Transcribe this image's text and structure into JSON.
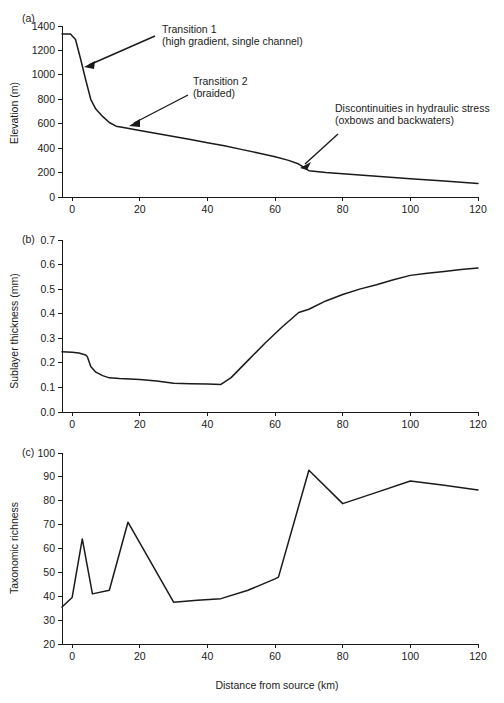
{
  "figure": {
    "xlabel": "Distance from source (km)",
    "panels": [
      {
        "letter": "(a)",
        "ylabel": "Elevation (m)",
        "yticks": [
          "0",
          "200",
          "400",
          "600",
          "800",
          "1000",
          "1200",
          "1400"
        ],
        "xticks": [
          "0",
          "20",
          "40",
          "60",
          "80",
          "100",
          "120"
        ]
      },
      {
        "letter": "(b)",
        "ylabel": "Sublayer thickness (mm)",
        "yticks": [
          "0.0",
          "0.1",
          "0.2",
          "0.3",
          "0.4",
          "0.5",
          "0.6",
          "0.7"
        ],
        "xticks": [
          "0",
          "20",
          "40",
          "60",
          "80",
          "100",
          "120"
        ]
      },
      {
        "letter": "(c)",
        "ylabel": "Taxonomic richness",
        "yticks": [
          "20",
          "30",
          "40",
          "50",
          "60",
          "70",
          "80",
          "90",
          "100"
        ],
        "xticks": [
          "0",
          "20",
          "40",
          "60",
          "80",
          "100",
          "120"
        ]
      }
    ],
    "annotations": [
      {
        "id": "transition-1",
        "line1": "Transition 1",
        "line2": "(high gradient, single channel)"
      },
      {
        "id": "transition-2",
        "line1": "Transition 2",
        "line2": "(braided)"
      },
      {
        "id": "discontinuities",
        "line1": "Discontinuities in hydraulic stress",
        "line2": "(oxbows and backwaters)"
      }
    ],
    "colors": {
      "line": "#1a1a1a",
      "axis": "#1a1a1a",
      "background": "#ffffff"
    }
  },
  "chart_data": [
    {
      "type": "line",
      "panel": "(a)",
      "title": "",
      "xlabel": "Distance from source (km)",
      "ylabel": "Elevation (m)",
      "xlim": [
        -3,
        120
      ],
      "ylim": [
        0,
        1400
      ],
      "xticks": [
        0,
        20,
        40,
        60,
        80,
        100,
        120
      ],
      "yticks": [
        0,
        200,
        400,
        600,
        800,
        1000,
        1200,
        1400
      ],
      "grid": false,
      "legend": "none",
      "x": [
        -3,
        -0.5,
        1,
        2.5,
        4,
        5.5,
        7,
        9,
        11,
        13,
        16,
        20,
        25,
        30,
        35,
        40,
        45,
        50,
        55,
        60,
        64,
        67,
        70,
        75,
        80,
        90,
        100,
        110,
        120
      ],
      "y": [
        1335,
        1335,
        1290,
        1130,
        960,
        800,
        720,
        660,
        610,
        580,
        565,
        545,
        520,
        495,
        470,
        445,
        420,
        390,
        360,
        330,
        300,
        270,
        215,
        200,
        190,
        170,
        150,
        130,
        110
      ]
    },
    {
      "type": "line",
      "panel": "(b)",
      "title": "",
      "xlabel": "Distance from source (km)",
      "ylabel": "Sublayer thickness (mm)",
      "xlim": [
        -3,
        120
      ],
      "ylim": [
        0.0,
        0.7
      ],
      "xticks": [
        0,
        20,
        40,
        60,
        80,
        100,
        120
      ],
      "yticks": [
        0.0,
        0.1,
        0.2,
        0.3,
        0.4,
        0.5,
        0.6,
        0.7
      ],
      "grid": false,
      "legend": "none",
      "x": [
        -3,
        0,
        2,
        4,
        4.5,
        5.5,
        7,
        9,
        11,
        14,
        20,
        25,
        30,
        35,
        40,
        44,
        47,
        52,
        57,
        62,
        67,
        70,
        75,
        80,
        85,
        90,
        95,
        100,
        105,
        110,
        115,
        120
      ],
      "y": [
        0.245,
        0.243,
        0.24,
        0.232,
        0.225,
        0.185,
        0.162,
        0.148,
        0.139,
        0.136,
        0.132,
        0.126,
        0.117,
        0.115,
        0.114,
        0.112,
        0.14,
        0.21,
        0.28,
        0.345,
        0.405,
        0.418,
        0.452,
        0.478,
        0.5,
        0.518,
        0.538,
        0.556,
        0.565,
        0.572,
        0.58,
        0.586
      ]
    },
    {
      "type": "line",
      "panel": "(c)",
      "title": "",
      "xlabel": "Distance from source (km)",
      "ylabel": "Taxonomic richness",
      "xlim": [
        -3,
        120
      ],
      "ylim": [
        20,
        100
      ],
      "xticks": [
        0,
        20,
        40,
        60,
        80,
        100,
        120
      ],
      "yticks": [
        20,
        30,
        40,
        50,
        60,
        70,
        80,
        90,
        100
      ],
      "grid": false,
      "legend": "none",
      "x": [
        -3,
        0,
        3,
        6,
        11,
        16.5,
        30,
        37,
        44,
        52,
        60,
        61,
        70,
        80,
        90,
        100,
        110,
        120
      ],
      "y": [
        35.5,
        39.5,
        64,
        41,
        42.5,
        71,
        37.5,
        38.3,
        39,
        42.5,
        47.3,
        48,
        92.8,
        78.8,
        83.5,
        88.3,
        86.5,
        84.5
      ]
    }
  ]
}
